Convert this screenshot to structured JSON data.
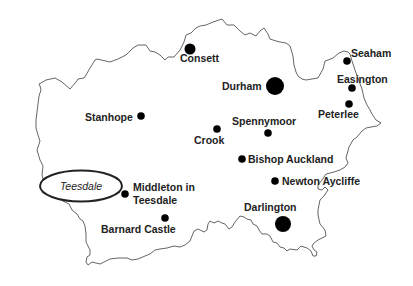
{
  "map": {
    "title": "County Durham towns",
    "region_label": "Teesdale",
    "towns": [
      {
        "name": "Consett",
        "x": 190,
        "y": 49,
        "r": 5.5,
        "lx": 180,
        "ly": 61
      },
      {
        "name": "Durham",
        "x": 275,
        "y": 86,
        "r": 9,
        "lx": 222,
        "ly": 90
      },
      {
        "name": "Seaham",
        "x": 347,
        "y": 61,
        "r": 4,
        "lx": 352,
        "ly": 57
      },
      {
        "name": "Easington",
        "x": 352,
        "y": 88,
        "r": 4,
        "lx": 337,
        "ly": 83
      },
      {
        "name": "Peterlee",
        "x": 349,
        "y": 104,
        "r": 4,
        "lx": 318,
        "ly": 118
      },
      {
        "name": "Stanhope",
        "x": 141,
        "y": 116,
        "r": 4,
        "lx": 85,
        "ly": 121
      },
      {
        "name": "Spennymoor",
        "x": 268,
        "y": 133,
        "r": 4,
        "lx": 232,
        "ly": 125
      },
      {
        "name": "Crook",
        "x": 217,
        "y": 129,
        "r": 4,
        "lx": 194,
        "ly": 144
      },
      {
        "name": "Bishop Auckland",
        "x": 242,
        "y": 159,
        "r": 4,
        "lx": 248,
        "ly": 163
      },
      {
        "name": "Newton Aycliffe",
        "x": 275,
        "y": 181,
        "r": 4,
        "lx": 282,
        "ly": 185
      },
      {
        "name": "Darlington",
        "x": 283,
        "y": 224,
        "r": 8,
        "lx": 244,
        "ly": 211
      },
      {
        "name": "Middleton in",
        "x": 125,
        "y": 194,
        "r": 4,
        "lx": 133,
        "ly": 191
      },
      {
        "name": "Barnard Castle",
        "x": 165,
        "y": 218,
        "r": 4,
        "lx": 101,
        "ly": 233
      }
    ],
    "labels": {
      "consett": "Consett",
      "durham": "Durham",
      "seaham": "Seaham",
      "easington": "Easington",
      "peterlee": "Peterlee",
      "stanhope": "Stanhope",
      "spennymoor": "Spennymoor",
      "crook": "Crook",
      "bishop_auckland": "Bishop Auckland",
      "newton_aycliffe": "Newton Aycliffe",
      "darlington": "Darlington",
      "middleton_line1": "Middleton in",
      "middleton_line2": "Teesdale",
      "barnard_castle": "Barnard Castle",
      "teesdale": "Teesdale"
    }
  }
}
